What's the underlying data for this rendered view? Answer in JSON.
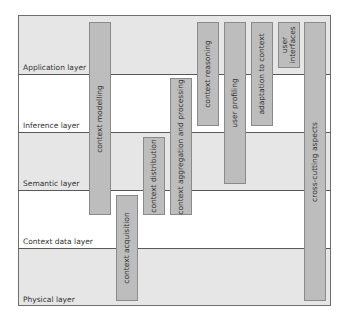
{
  "layers": [
    {
      "label": "Application layer",
      "shade": "shaded"
    },
    {
      "label": "Inference layer",
      "shade": "white"
    },
    {
      "label": "Semantic layer",
      "shade": "shaded"
    },
    {
      "label": "Context data layer",
      "shade": "white"
    },
    {
      "label": "Physical layer",
      "shade": "shaded"
    }
  ],
  "boxes": [
    {
      "label": "context modelling"
    },
    {
      "label": "context acquisition"
    },
    {
      "label": "context distribution"
    },
    {
      "label": "context aggregation and processing"
    },
    {
      "label": "context  reasoning"
    },
    {
      "label": "user profiling"
    },
    {
      "label": "adaptation to context"
    },
    {
      "label": "user interfaces",
      "line1": "user",
      "line2": "interfaces"
    },
    {
      "label": "cross-cutting aspects"
    }
  ],
  "colors": {
    "layer_shade": "#e6e6e6",
    "box_fill": "#bdbdbd",
    "border": "#6e6e6e"
  }
}
